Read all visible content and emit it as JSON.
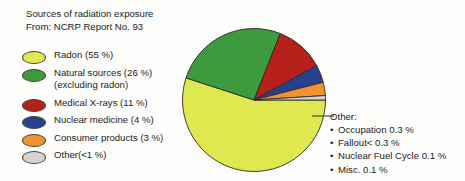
{
  "title": {
    "line1": "Sources of radiation exposure",
    "line2": "From: NCRP Report No. 93"
  },
  "legend": {
    "items": [
      {
        "label": "Radon (55 %)",
        "sub": "",
        "color": "#dfe84e",
        "name": "radon"
      },
      {
        "label": "Natural sources (26 %)",
        "sub": "(excluding radon)",
        "color": "#3d9a3d",
        "name": "natural-sources"
      },
      {
        "label": "Medical X-rays (11 %)",
        "sub": "",
        "color": "#b7201a",
        "name": "medical-xrays"
      },
      {
        "label": "Nuclear medicine (4 %)",
        "sub": "",
        "color": "#27418f",
        "name": "nuclear-medicine"
      },
      {
        "label": "Consumer products (3 %)",
        "sub": "",
        "color": "#f0922e",
        "name": "consumer-products"
      },
      {
        "label": "Other(<1 %)",
        "sub": "",
        "color": "#d4d4d4",
        "name": "other"
      }
    ]
  },
  "callout": {
    "heading": "Other:",
    "bullet": "•",
    "items": [
      "Occupation 0.3 %",
      "Fallout< 0.3 %",
      "Nuclear Fuel Cycle 0.1 %",
      "Misc. 0.1 %"
    ]
  },
  "chart_data": {
    "type": "pie",
    "title": "Sources of radiation exposure",
    "subtitle": "From: NCRP Report No. 93",
    "units": "percent",
    "start_angle_deg": 0,
    "direction": "clockwise",
    "legend_position": "left",
    "grid": false,
    "labels": [
      "Radon",
      "Natural sources (excluding radon)",
      "Medical X-rays",
      "Nuclear medicine",
      "Consumer products",
      "Other"
    ],
    "values": [
      55,
      26,
      11,
      4,
      3,
      1
    ],
    "value_texts": [
      "55 %",
      "26 %",
      "11 %",
      "4 %",
      "3 %",
      "<1 %"
    ],
    "colors": [
      "#dfe84e",
      "#3d9a3d",
      "#b7201a",
      "#27418f",
      "#f0922e",
      "#d4d4d4"
    ],
    "annotations": {
      "Other": [
        {
          "label": "Occupation",
          "value": 0.3,
          "text": "Occupation 0.3 %"
        },
        {
          "label": "Fallout",
          "value": 0.3,
          "text": "Fallout< 0.3 %"
        },
        {
          "label": "Nuclear Fuel Cycle",
          "value": 0.1,
          "text": "Nuclear Fuel Cycle 0.1 %"
        },
        {
          "label": "Misc.",
          "value": 0.1,
          "text": "Misc. 0.1 %"
        }
      ]
    }
  }
}
